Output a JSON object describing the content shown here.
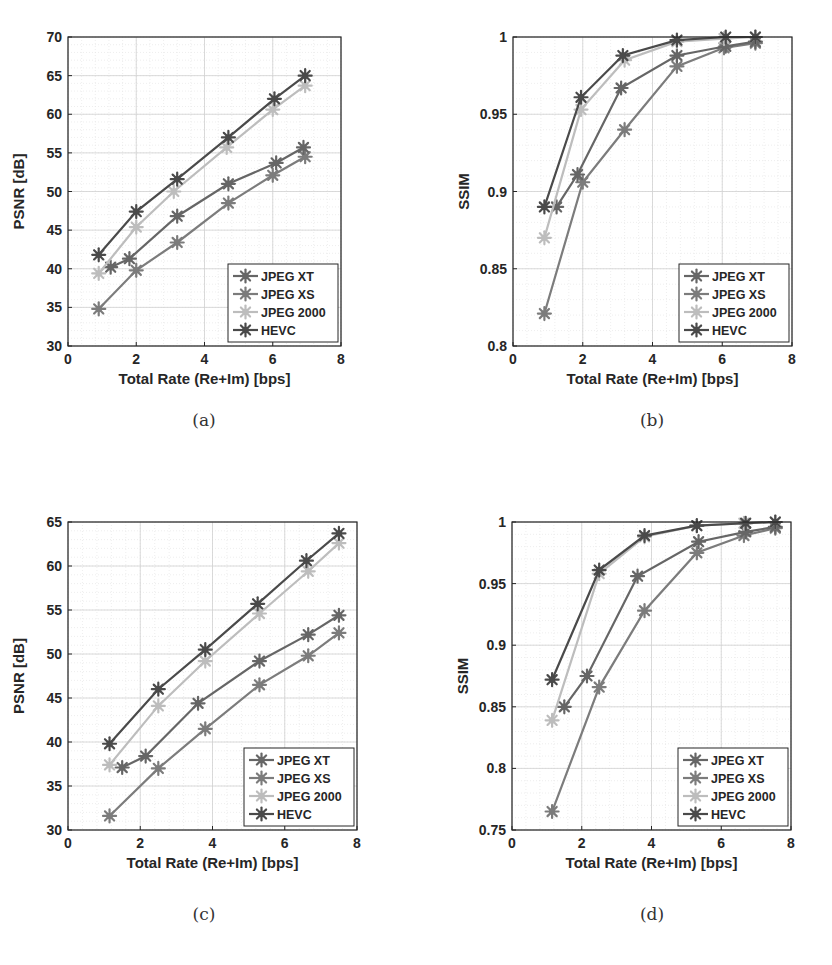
{
  "figure": {
    "captions": [
      "(a)",
      "(b)",
      "(c)",
      "(d)"
    ]
  },
  "legend": [
    "JPEG XT",
    "JPEG XS",
    "JPEG 2000",
    "HEVC"
  ],
  "series_colors": {
    "JPEG XT": "#666666",
    "JPEG XS": "#7c7c7c",
    "JPEG 2000": "#bdbdbd",
    "HEVC": "#4a4a4a"
  },
  "chart_data": [
    {
      "id": "a",
      "type": "line",
      "title": "",
      "xlabel": "Total Rate (Re+Im) [bps]",
      "ylabel": "PSNR [dB]",
      "xlim": [
        0,
        8
      ],
      "ylim": [
        30,
        70
      ],
      "xticks": [
        0,
        2,
        4,
        6,
        8
      ],
      "yticks": [
        30,
        35,
        40,
        45,
        50,
        55,
        60,
        65,
        70
      ],
      "grid": true,
      "legend_position": "lower right",
      "series": [
        {
          "name": "JPEG XT",
          "x": [
            1.25,
            1.8,
            3.2,
            4.7,
            6.1,
            6.9
          ],
          "y": [
            40.2,
            41.3,
            46.8,
            51.0,
            53.7,
            55.7
          ]
        },
        {
          "name": "JPEG XS",
          "x": [
            0.9,
            2.0,
            3.2,
            4.7,
            6.0,
            6.95
          ],
          "y": [
            34.8,
            39.8,
            43.4,
            48.5,
            52.1,
            54.5
          ]
        },
        {
          "name": "JPEG 2000",
          "x": [
            0.9,
            2.0,
            3.1,
            4.65,
            6.0,
            6.95
          ],
          "y": [
            39.4,
            45.4,
            50.0,
            55.7,
            60.6,
            63.7
          ]
        },
        {
          "name": "HEVC",
          "x": [
            0.9,
            2.0,
            3.2,
            4.7,
            6.05,
            6.95
          ],
          "y": [
            41.8,
            47.4,
            51.6,
            57.0,
            62.0,
            65.0
          ]
        }
      ]
    },
    {
      "id": "b",
      "type": "line",
      "title": "",
      "xlabel": "Total Rate (Re+Im) [bps]",
      "ylabel": "SSIM",
      "xlim": [
        0,
        8
      ],
      "ylim": [
        0.8,
        1
      ],
      "xticks": [
        0,
        2,
        4,
        6,
        8
      ],
      "yticks": [
        0.8,
        0.85,
        0.9,
        0.95,
        1
      ],
      "grid": true,
      "legend_position": "lower right",
      "series": [
        {
          "name": "JPEG XT",
          "x": [
            1.25,
            1.85,
            3.1,
            4.7,
            6.1,
            6.95
          ],
          "y": [
            0.89,
            0.911,
            0.967,
            0.988,
            0.994,
            0.997
          ]
        },
        {
          "name": "JPEG XS",
          "x": [
            0.9,
            2.0,
            3.2,
            4.7,
            6.05,
            6.95
          ],
          "y": [
            0.821,
            0.906,
            0.94,
            0.981,
            0.993,
            0.996
          ]
        },
        {
          "name": "JPEG 2000",
          "x": [
            0.9,
            1.95,
            3.2,
            4.7,
            6.05,
            6.95
          ],
          "y": [
            0.87,
            0.953,
            0.985,
            0.997,
            0.999,
            1.0
          ]
        },
        {
          "name": "HEVC",
          "x": [
            0.9,
            1.95,
            3.15,
            4.7,
            6.1,
            6.95
          ],
          "y": [
            0.89,
            0.961,
            0.988,
            0.998,
            1.0,
            1.0
          ]
        }
      ]
    },
    {
      "id": "c",
      "type": "line",
      "title": "",
      "xlabel": "Total Rate (Re+Im) [bps]",
      "ylabel": "PSNR [dB]",
      "xlim": [
        0,
        8
      ],
      "ylim": [
        30,
        65
      ],
      "xticks": [
        0,
        2,
        4,
        6,
        8
      ],
      "yticks": [
        30,
        35,
        40,
        45,
        50,
        55,
        60,
        65
      ],
      "grid": true,
      "legend_position": "lower right",
      "series": [
        {
          "name": "JPEG XT",
          "x": [
            1.5,
            2.15,
            3.6,
            5.3,
            6.65,
            7.5
          ],
          "y": [
            37.1,
            38.4,
            44.4,
            49.2,
            52.2,
            54.4
          ]
        },
        {
          "name": "JPEG XS",
          "x": [
            1.15,
            2.5,
            3.8,
            5.3,
            6.65,
            7.5
          ],
          "y": [
            31.6,
            37.0,
            41.5,
            46.5,
            49.8,
            52.4
          ]
        },
        {
          "name": "JPEG 2000",
          "x": [
            1.15,
            2.5,
            3.8,
            5.3,
            6.65,
            7.5
          ],
          "y": [
            37.4,
            44.1,
            49.2,
            54.6,
            59.4,
            62.6
          ]
        },
        {
          "name": "HEVC",
          "x": [
            1.15,
            2.5,
            3.8,
            5.25,
            6.6,
            7.5
          ],
          "y": [
            39.8,
            46.0,
            50.5,
            55.7,
            60.6,
            63.7
          ]
        }
      ]
    },
    {
      "id": "d",
      "type": "line",
      "title": "",
      "xlabel": "Total Rate (Re+Im) [bps]",
      "ylabel": "SSIM",
      "xlim": [
        0,
        8
      ],
      "ylim": [
        0.75,
        1
      ],
      "xticks": [
        0,
        2,
        4,
        6,
        8
      ],
      "yticks": [
        0.75,
        0.8,
        0.85,
        0.9,
        0.95,
        1
      ],
      "grid": true,
      "legend_position": "lower right",
      "series": [
        {
          "name": "JPEG XT",
          "x": [
            1.5,
            2.15,
            3.6,
            5.35,
            6.7,
            7.55
          ],
          "y": [
            0.85,
            0.875,
            0.956,
            0.984,
            0.992,
            0.996
          ]
        },
        {
          "name": "JPEG XS",
          "x": [
            1.15,
            2.5,
            3.8,
            5.3,
            6.65,
            7.55
          ],
          "y": [
            0.765,
            0.866,
            0.928,
            0.975,
            0.989,
            0.995
          ]
        },
        {
          "name": "JPEG 2000",
          "x": [
            1.15,
            2.5,
            3.8,
            5.3,
            6.65,
            7.55
          ],
          "y": [
            0.839,
            0.958,
            0.988,
            0.997,
            0.999,
            1.0
          ]
        },
        {
          "name": "HEVC",
          "x": [
            1.15,
            2.5,
            3.8,
            5.3,
            6.7,
            7.55
          ],
          "y": [
            0.872,
            0.961,
            0.989,
            0.997,
            0.999,
            1.0
          ]
        }
      ]
    }
  ]
}
